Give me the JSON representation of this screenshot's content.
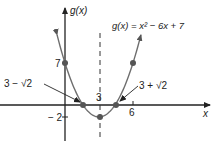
{
  "chart_data": {
    "type": "line",
    "title": "g(x) = x² − 6x + 7",
    "function": "x^2 - 6x + 7",
    "xlabel": "x",
    "ylabel": "g(x)",
    "x_ticks": [
      {
        "value": 3,
        "label": "3"
      },
      {
        "value": 6,
        "label": "6"
      }
    ],
    "y_ticks": [
      {
        "value": 7,
        "label": "7"
      },
      {
        "value": -2,
        "label": "− 2"
      }
    ],
    "axis_of_symmetry": {
      "x": 3,
      "style": "dashed"
    },
    "points": [
      {
        "x": 0,
        "y": 7
      },
      {
        "x": 1.586,
        "y": 0,
        "label": "3 − √2"
      },
      {
        "x": 3,
        "y": -2
      },
      {
        "x": 4.414,
        "y": 0,
        "label": "3 + √2"
      },
      {
        "x": 6,
        "y": 7
      }
    ],
    "grid": false,
    "colors": {
      "curve": "#6e6e6e",
      "points": "#555555",
      "axes": "#222222"
    }
  },
  "labels": {
    "y_axis": "g(x)",
    "x_axis": "x",
    "equation": "g(x) = x² − 6x + 7",
    "tick_7": "7",
    "tick_neg2": "− 2",
    "tick_3": "3",
    "tick_6": "6",
    "root_left": "3 − √2",
    "root_right": "3 + √2"
  }
}
